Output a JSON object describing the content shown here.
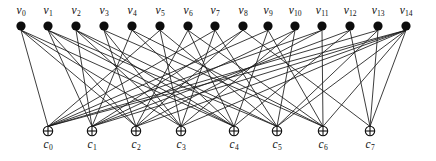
{
  "figure": {
    "type": "tanner-graph",
    "background_color": "#ffffff",
    "edge_color": "#1a1a1a",
    "variable_node_color": "#0d0d0d",
    "check_node_color": "#ffffff",
    "check_node_stroke": "#0d0d0d",
    "width": 436,
    "height": 161
  },
  "variable_nodes": [
    {
      "id": "v0",
      "symbol": "v",
      "subscript": "0",
      "x": 21,
      "y": 26
    },
    {
      "id": "v1",
      "symbol": "v",
      "subscript": "1",
      "x": 48,
      "y": 26
    },
    {
      "id": "v2",
      "symbol": "v",
      "subscript": "2",
      "x": 76,
      "y": 26
    },
    {
      "id": "v3",
      "symbol": "v",
      "subscript": "3",
      "x": 104,
      "y": 26
    },
    {
      "id": "v4",
      "symbol": "v",
      "subscript": "4",
      "x": 132,
      "y": 26
    },
    {
      "id": "v5",
      "symbol": "v",
      "subscript": "5",
      "x": 160,
      "y": 26
    },
    {
      "id": "v6",
      "symbol": "v",
      "subscript": "6",
      "x": 188,
      "y": 26
    },
    {
      "id": "v7",
      "symbol": "v",
      "subscript": "7",
      "x": 215,
      "y": 26
    },
    {
      "id": "v8",
      "symbol": "v",
      "subscript": "8",
      "x": 243,
      "y": 26
    },
    {
      "id": "v9",
      "symbol": "v",
      "subscript": "9",
      "x": 268,
      "y": 26
    },
    {
      "id": "v10",
      "symbol": "v",
      "subscript": "10",
      "x": 295,
      "y": 26
    },
    {
      "id": "v11",
      "symbol": "v",
      "subscript": "11",
      "x": 322,
      "y": 26
    },
    {
      "id": "v12",
      "symbol": "v",
      "subscript": "12",
      "x": 350,
      "y": 26
    },
    {
      "id": "v13",
      "symbol": "v",
      "subscript": "13",
      "x": 378,
      "y": 26
    },
    {
      "id": "v14",
      "symbol": "v",
      "subscript": "14",
      "x": 406,
      "y": 26
    }
  ],
  "check_nodes": [
    {
      "id": "c0",
      "symbol": "c",
      "subscript": "0",
      "x": 48,
      "y": 131
    },
    {
      "id": "c1",
      "symbol": "c",
      "subscript": "1",
      "x": 92,
      "y": 131
    },
    {
      "id": "c2",
      "symbol": "c",
      "subscript": "2",
      "x": 136,
      "y": 131
    },
    {
      "id": "c3",
      "symbol": "c",
      "subscript": "3",
      "x": 181,
      "y": 131
    },
    {
      "id": "c4",
      "symbol": "c",
      "subscript": "4",
      "x": 234,
      "y": 131
    },
    {
      "id": "c5",
      "symbol": "c",
      "subscript": "5",
      "x": 277,
      "y": 131
    },
    {
      "id": "c6",
      "symbol": "c",
      "subscript": "6",
      "x": 323,
      "y": 131
    },
    {
      "id": "c7",
      "symbol": "c",
      "subscript": "7",
      "x": 370,
      "y": 131
    }
  ],
  "edges": [
    {
      "from": "v0",
      "to": "c0"
    },
    {
      "from": "v0",
      "to": "c2"
    },
    {
      "from": "v0",
      "to": "c3"
    },
    {
      "from": "v0",
      "to": "c4"
    },
    {
      "from": "v1",
      "to": "c1"
    },
    {
      "from": "v1",
      "to": "c2"
    },
    {
      "from": "v1",
      "to": "c4"
    },
    {
      "from": "v1",
      "to": "c5"
    },
    {
      "from": "v2",
      "to": "c1"
    },
    {
      "from": "v2",
      "to": "c3"
    },
    {
      "from": "v2",
      "to": "c4"
    },
    {
      "from": "v2",
      "to": "c5"
    },
    {
      "from": "v3",
      "to": "c2"
    },
    {
      "from": "v3",
      "to": "c3"
    },
    {
      "from": "v3",
      "to": "c6"
    },
    {
      "from": "v4",
      "to": "c1"
    },
    {
      "from": "v4",
      "to": "c4"
    },
    {
      "from": "v4",
      "to": "c6"
    },
    {
      "from": "v5",
      "to": "c0"
    },
    {
      "from": "v5",
      "to": "c3"
    },
    {
      "from": "v5",
      "to": "c5"
    },
    {
      "from": "v6",
      "to": "c2"
    },
    {
      "from": "v6",
      "to": "c4"
    },
    {
      "from": "v6",
      "to": "c6"
    },
    {
      "from": "v7",
      "to": "c0"
    },
    {
      "from": "v7",
      "to": "c3"
    },
    {
      "from": "v7",
      "to": "c5"
    },
    {
      "from": "v8",
      "to": "c1"
    },
    {
      "from": "v8",
      "to": "c2"
    },
    {
      "from": "v8",
      "to": "c7"
    },
    {
      "from": "v9",
      "to": "c0"
    },
    {
      "from": "v9",
      "to": "c4"
    },
    {
      "from": "v9",
      "to": "c6"
    },
    {
      "from": "v10",
      "to": "c1"
    },
    {
      "from": "v10",
      "to": "c3"
    },
    {
      "from": "v10",
      "to": "c5"
    },
    {
      "from": "v11",
      "to": "c0"
    },
    {
      "from": "v11",
      "to": "c2"
    },
    {
      "from": "v11",
      "to": "c6"
    },
    {
      "from": "v12",
      "to": "c1"
    },
    {
      "from": "v12",
      "to": "c4"
    },
    {
      "from": "v12",
      "to": "c7"
    },
    {
      "from": "v13",
      "to": "c0"
    },
    {
      "from": "v13",
      "to": "c5"
    },
    {
      "from": "v13",
      "to": "c7"
    },
    {
      "from": "v14",
      "to": "c0"
    },
    {
      "from": "v14",
      "to": "c1"
    },
    {
      "from": "v14",
      "to": "c2"
    },
    {
      "from": "v14",
      "to": "c3"
    },
    {
      "from": "v14",
      "to": "c5"
    },
    {
      "from": "v14",
      "to": "c6"
    },
    {
      "from": "v14",
      "to": "c7"
    }
  ]
}
